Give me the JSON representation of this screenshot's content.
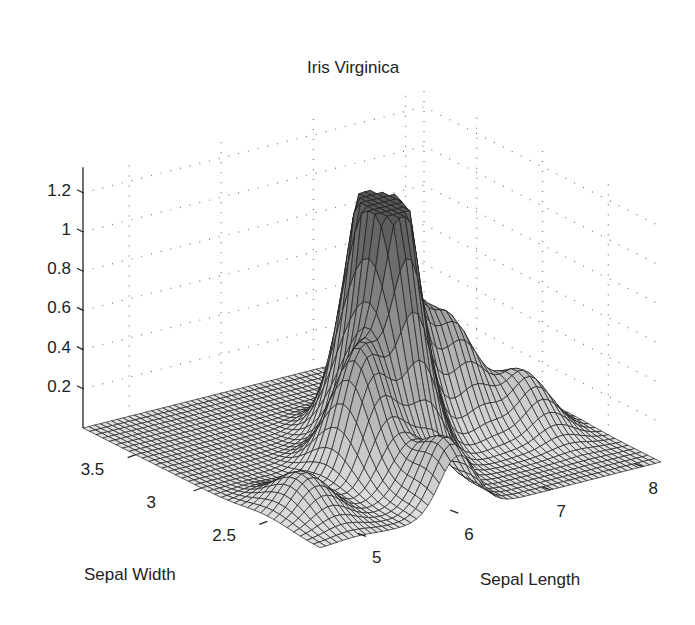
{
  "chart_data": {
    "type": "surface",
    "title": "Iris Virginica",
    "xlabel": "Sepal Length",
    "ylabel": "Sepal Width",
    "zlabel": "",
    "x_ticks": [
      5,
      6,
      7,
      8
    ],
    "y_ticks": [
      2.5,
      3,
      3.5
    ],
    "z_ticks": [
      0.2,
      0.4,
      0.6,
      0.8,
      1,
      1.2
    ],
    "x_tick_labels": [
      "5",
      "6",
      "7",
      "8"
    ],
    "y_tick_labels": [
      "2.5",
      "3",
      "3.5"
    ],
    "z_tick_labels": [
      "0.2",
      "0.4",
      "0.6",
      "0.8",
      "1",
      "1.2"
    ],
    "xlim": [
      4.5,
      8.2
    ],
    "ylim": [
      2.1,
      3.9
    ],
    "zlim": [
      0,
      1.3
    ],
    "grid": true,
    "grid_style": "dotted",
    "peaks": [
      {
        "x": 6.4,
        "y": 3.0,
        "z": 1.23,
        "note": "global maximum"
      },
      {
        "x": 6.3,
        "y": 2.8,
        "z": 0.95
      },
      {
        "x": 5.8,
        "y": 2.7,
        "z": 0.62
      },
      {
        "x": 7.2,
        "y": 3.0,
        "z": 0.5
      },
      {
        "x": 6.8,
        "y": 3.1,
        "z": 0.55
      },
      {
        "x": 7.7,
        "y": 2.8,
        "z": 0.28
      },
      {
        "x": 6.0,
        "y": 2.2,
        "z": 0.35
      },
      {
        "x": 4.9,
        "y": 2.5,
        "z": 0.2
      }
    ]
  },
  "labels": {
    "title": "Iris Virginica",
    "xlabel": "Sepal Length",
    "ylabel": "Sepal Width"
  }
}
